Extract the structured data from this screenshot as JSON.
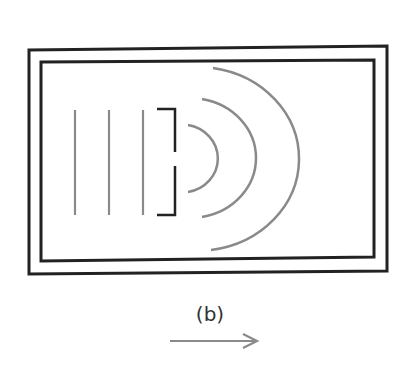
{
  "figure": {
    "label": "(b)",
    "colors": {
      "frame": "#222222",
      "waves": "#8a8a8a",
      "barrier": "#222222",
      "arrow": "#8a8a8a",
      "label": "#333333"
    },
    "incident_wavefronts": [
      {
        "x": 75,
        "y1": 110,
        "y2": 215
      },
      {
        "x": 109,
        "y1": 110,
        "y2": 215
      },
      {
        "x": 143,
        "y1": 110,
        "y2": 215
      }
    ],
    "slit": {
      "x": 175,
      "gap_top": 152,
      "gap_bottom": 166
    },
    "diffracted_wavefronts": [
      {
        "radius": 36
      },
      {
        "radius": 64
      },
      {
        "radius": 100
      }
    ],
    "arrow": {
      "direction": "right"
    }
  }
}
